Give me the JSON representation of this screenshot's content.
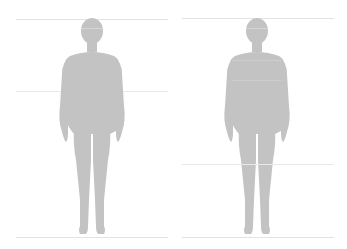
{
  "diagram": {
    "type": "body-measurement-guide",
    "figure_color": "#c3c3c3",
    "line_color": "#e3e3e3",
    "background": "#ffffff",
    "panels": [
      {
        "id": "left",
        "measurement": "height-and-waist",
        "lines_y": [
          19,
          91,
          237
        ]
      },
      {
        "id": "right",
        "measurement": "height-and-inseam",
        "lines_y": [
          18,
          164,
          237
        ]
      }
    ]
  }
}
